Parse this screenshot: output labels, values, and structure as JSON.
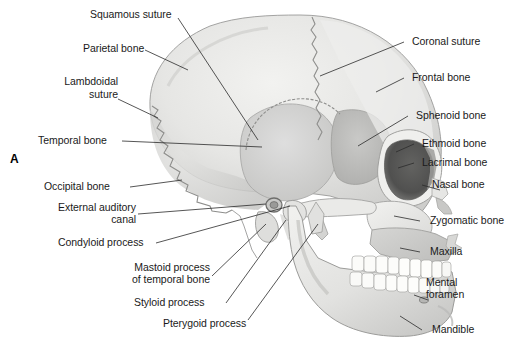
{
  "figure": {
    "panel_letter": "A",
    "view": "lateral view of human skull",
    "background_color": "#ffffff",
    "line_color": "#2b2b2b",
    "text_color": "#1a1a1a"
  },
  "labels": {
    "squamous_suture": "Squamous suture",
    "parietal_bone": "Parietal bone",
    "lambdoidal_line1": "Lambdoidal",
    "lambdoidal_line2": "suture",
    "temporal_bone": "Temporal bone",
    "occipital_bone": "Occipital bone",
    "external_auditory_line1": "External auditory",
    "external_auditory_line2": "canal",
    "condyloid_process": "Condyloid process",
    "mastoid_line1": "Mastoid process",
    "mastoid_line2": "of temporal bone",
    "styloid_process": "Styloid process",
    "pterygoid_process": "Pterygoid process",
    "coronal_suture": "Coronal suture",
    "frontal_bone": "Frontal bone",
    "sphenoid_bone": "Sphenoid bone",
    "ethmoid_bone": "Ethmoid bone",
    "lacrimal_bone": "Lacrimal bone",
    "nasal_bone": "Nasal bone",
    "zygomatic_bone": "Zygomatic bone",
    "maxilla": "Maxilla",
    "mental_line1": "Mental",
    "mental_line2": "foramen",
    "mandible": "Mandible"
  },
  "colors": {
    "cranium_light": "#e9e9e7",
    "cranium_mid": "#dcdcda",
    "cranium_shadow": "#cfcfcd",
    "temporal_fossa": "#d2d2d0",
    "sphenoid": "#bdbdbb",
    "orbit_dark": "#6f6f6d",
    "orbit_deep": "#4f4f4e",
    "facial_light": "#efefee",
    "mandible": "#e4e4e2",
    "teeth": "#fafaf8",
    "outline": "#8d8d8b"
  }
}
